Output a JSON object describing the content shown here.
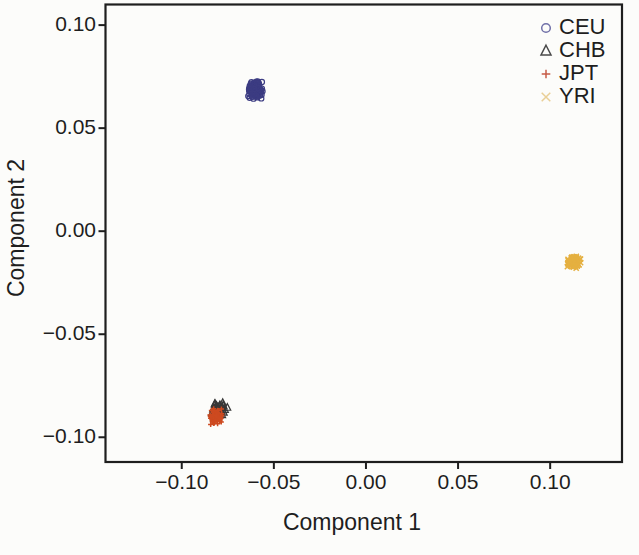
{
  "figure": {
    "background": "#fcfcfa",
    "axis_color": "#1e1e1e",
    "text_color": "#1e1e1e"
  },
  "chart_data": {
    "type": "scatter",
    "title": "",
    "xlabel": "Component 1",
    "ylabel": "Component 2",
    "xlim": [
      -0.1414,
      0.139
    ],
    "ylim": [
      -0.112,
      0.11
    ],
    "grid": false,
    "box": true,
    "xticks": [
      -0.1,
      -0.05,
      0.0,
      0.05,
      0.1
    ],
    "yticks": [
      -0.1,
      -0.05,
      0.0,
      0.05,
      0.1
    ],
    "xtick_labels": [
      "−0.10",
      "−0.05",
      "0.00",
      "0.05",
      "0.10"
    ],
    "ytick_labels": [
      "−0.10",
      "−0.05",
      "0.00",
      "0.05",
      "0.10"
    ],
    "legend": {
      "position": "top-right",
      "items": [
        {
          "label": "CEU",
          "marker": "circle",
          "color": "#7070a8"
        },
        {
          "label": "CHB",
          "marker": "triangle",
          "color": "#4a4a4a"
        },
        {
          "label": "JPT",
          "marker": "plus",
          "color": "#c65b47"
        },
        {
          "label": "YRI",
          "marker": "x",
          "color": "#e9cf97"
        }
      ]
    },
    "series": [
      {
        "name": "CHB",
        "marker": "triangle",
        "color": "#383838",
        "center": [
          -0.08,
          -0.0872
        ],
        "spread": [
          0.0052,
          0.005
        ],
        "n": 55,
        "seed": 202
      },
      {
        "name": "JPT",
        "marker": "plus",
        "color": "#cd4a20",
        "center": [
          -0.0818,
          -0.0902
        ],
        "spread": [
          0.0042,
          0.0046
        ],
        "n": 80,
        "seed": 303
      },
      {
        "name": "CEU",
        "marker": "circle",
        "color": "#3c3c82",
        "center": [
          -0.0598,
          0.0688
        ],
        "spread": [
          0.0054,
          0.0056
        ],
        "n": 130,
        "seed": 101
      },
      {
        "name": "YRI",
        "marker": "x",
        "color": "#e5b040",
        "center": [
          0.1124,
          -0.0148
        ],
        "spread": [
          0.0044,
          0.0036
        ],
        "n": 110,
        "seed": 404
      }
    ],
    "cluster_summary": [
      {
        "population": "CEU",
        "component1": -0.06,
        "component2": 0.069
      },
      {
        "population": "CHB",
        "component1": -0.08,
        "component2": -0.088
      },
      {
        "population": "JPT",
        "component1": -0.082,
        "component2": -0.09
      },
      {
        "population": "YRI",
        "component1": 0.112,
        "component2": -0.015
      }
    ]
  }
}
